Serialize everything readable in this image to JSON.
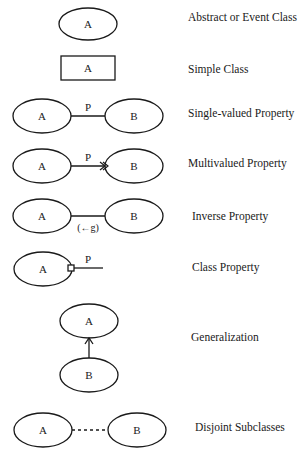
{
  "legend": {
    "rows": [
      {
        "id": "abstract",
        "label": "Abstract or Event Class",
        "a": "A"
      },
      {
        "id": "simple",
        "label": "Simple Class",
        "a": "A"
      },
      {
        "id": "single",
        "label": "Single-valued Property",
        "a": "A",
        "b": "B",
        "p": "P"
      },
      {
        "id": "multi",
        "label": "Multivalued Property",
        "a": "A",
        "b": "B",
        "p": "P"
      },
      {
        "id": "inverse",
        "label": "Inverse Property",
        "a": "A",
        "b": "B",
        "p": "(←g)"
      },
      {
        "id": "classprop",
        "label": "Class Property",
        "a": "A",
        "p": "P"
      },
      {
        "id": "generalization",
        "label": "Generalization",
        "a": "A",
        "b": "B"
      },
      {
        "id": "disjoint",
        "label": "Disjoint Subclasses",
        "a": "A",
        "b": "B"
      }
    ]
  },
  "colors": {
    "stroke": "#1a1a1a",
    "background": "#ffffff"
  }
}
